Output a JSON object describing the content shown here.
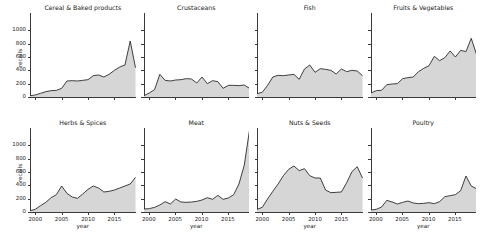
{
  "figure": {
    "title": "",
    "xlabel": "year",
    "ylabel": "recalls",
    "rows": 2,
    "cols": 4
  },
  "axes": {
    "x_ticks": [
      "2000",
      "2005",
      "2010",
      "2015"
    ],
    "x_tick_values": [
      2000,
      2005,
      2010,
      2015
    ],
    "y_ticks": [
      "0",
      "200",
      "400",
      "600",
      "800",
      "1000"
    ],
    "y_tick_values": [
      0,
      200,
      400,
      600,
      800,
      1000
    ],
    "xlim": [
      1999,
      2019
    ],
    "ylim": [
      0,
      1260
    ]
  },
  "style": {
    "fill_color": "#d6d6d6",
    "line_color": "#2b2b2b",
    "axis_color": "#3a3a3a",
    "text_color": "#1a1a1a",
    "background": "#ffffff"
  },
  "chart_data": {
    "type": "area",
    "title": "",
    "xlabel": "year",
    "ylabel": "recalls",
    "xlim": [
      1999,
      2019
    ],
    "ylim": [
      0,
      1260
    ],
    "grid": false,
    "legend": "none",
    "shared_x": true,
    "shared_y": true,
    "x": [
      1999,
      2000,
      2001,
      2002,
      2003,
      2004,
      2005,
      2006,
      2007,
      2008,
      2009,
      2010,
      2011,
      2012,
      2013,
      2014,
      2015,
      2016,
      2017,
      2018,
      2019
    ],
    "panels": [
      {
        "title": "Cereal & Baked products",
        "row": 0,
        "col": 0,
        "values": [
          20,
          30,
          55,
          80,
          95,
          100,
          130,
          240,
          245,
          240,
          250,
          260,
          320,
          330,
          300,
          340,
          400,
          450,
          480,
          840,
          440
        ]
      },
      {
        "title": "Crustaceans",
        "row": 0,
        "col": 1,
        "values": [
          20,
          60,
          110,
          340,
          250,
          240,
          255,
          260,
          275,
          270,
          210,
          300,
          200,
          245,
          230,
          130,
          175,
          175,
          170,
          180,
          130
        ]
      },
      {
        "title": "Fish",
        "row": 0,
        "col": 2,
        "values": [
          50,
          70,
          175,
          300,
          325,
          320,
          330,
          340,
          265,
          420,
          480,
          370,
          425,
          415,
          400,
          345,
          420,
          380,
          400,
          390,
          320
        ]
      },
      {
        "title": "Fruits & Vegetables",
        "row": 0,
        "col": 3,
        "values": [
          60,
          95,
          100,
          185,
          195,
          200,
          275,
          290,
          300,
          380,
          430,
          470,
          610,
          545,
          590,
          690,
          600,
          700,
          680,
          880,
          640
        ]
      },
      {
        "title": "Herbs & Spices",
        "row": 1,
        "col": 0,
        "values": [
          20,
          40,
          95,
          145,
          215,
          260,
          390,
          280,
          225,
          205,
          270,
          340,
          390,
          360,
          300,
          310,
          330,
          360,
          390,
          420,
          520
        ]
      },
      {
        "title": "Meat",
        "row": 1,
        "col": 1,
        "values": [
          45,
          50,
          70,
          105,
          155,
          120,
          195,
          150,
          145,
          150,
          160,
          180,
          215,
          190,
          250,
          190,
          210,
          260,
          420,
          700,
          1225
        ]
      },
      {
        "title": "Nuts & Seeds",
        "row": 1,
        "col": 2,
        "values": [
          40,
          70,
          195,
          310,
          420,
          545,
          640,
          690,
          620,
          650,
          545,
          510,
          510,
          330,
          290,
          295,
          300,
          440,
          605,
          680,
          510
        ]
      },
      {
        "title": "Poultry",
        "row": 1,
        "col": 3,
        "values": [
          30,
          40,
          75,
          175,
          150,
          120,
          145,
          165,
          135,
          125,
          130,
          140,
          125,
          155,
          230,
          245,
          260,
          320,
          540,
          390,
          350
        ]
      }
    ]
  }
}
